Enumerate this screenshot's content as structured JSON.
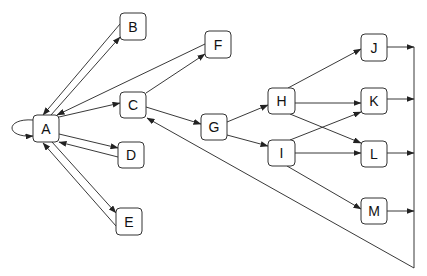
{
  "diagram": {
    "type": "directed-graph",
    "colors": {
      "stroke": "#222222",
      "node_fill": "#ffffff",
      "text": "#111111"
    },
    "nodes": [
      {
        "id": "A",
        "label": "A",
        "x": 33,
        "y": 115,
        "w": 26,
        "h": 27
      },
      {
        "id": "B",
        "label": "B",
        "x": 120,
        "y": 13,
        "w": 26,
        "h": 27
      },
      {
        "id": "C",
        "label": "C",
        "x": 120,
        "y": 92,
        "w": 26,
        "h": 26
      },
      {
        "id": "D",
        "label": "D",
        "x": 118,
        "y": 142,
        "w": 26,
        "h": 26
      },
      {
        "id": "E",
        "label": "E",
        "x": 116,
        "y": 208,
        "w": 26,
        "h": 27
      },
      {
        "id": "F",
        "label": "F",
        "x": 205,
        "y": 31,
        "w": 26,
        "h": 27
      },
      {
        "id": "G",
        "label": "G",
        "x": 201,
        "y": 114,
        "w": 26,
        "h": 26
      },
      {
        "id": "H",
        "label": "H",
        "x": 268,
        "y": 88,
        "w": 27,
        "h": 26
      },
      {
        "id": "I",
        "label": "I",
        "x": 268,
        "y": 140,
        "w": 27,
        "h": 26
      },
      {
        "id": "J",
        "label": "J",
        "x": 361,
        "y": 34,
        "w": 26,
        "h": 27
      },
      {
        "id": "K",
        "label": "K",
        "x": 361,
        "y": 88,
        "w": 26,
        "h": 26
      },
      {
        "id": "L",
        "label": "L",
        "x": 361,
        "y": 141,
        "w": 26,
        "h": 26
      },
      {
        "id": "M",
        "label": "M",
        "x": 361,
        "y": 198,
        "w": 26,
        "h": 26
      }
    ],
    "edges": [
      {
        "from": "A",
        "to": "A",
        "kind": "self-loop"
      },
      {
        "from": "A",
        "to": "B"
      },
      {
        "from": "B",
        "to": "A"
      },
      {
        "from": "A",
        "to": "C"
      },
      {
        "from": "F",
        "to": "A"
      },
      {
        "from": "C",
        "to": "F"
      },
      {
        "from": "A",
        "to": "D"
      },
      {
        "from": "D",
        "to": "A"
      },
      {
        "from": "A",
        "to": "E"
      },
      {
        "from": "E",
        "to": "A"
      },
      {
        "from": "C",
        "to": "G"
      },
      {
        "from": "G",
        "to": "H"
      },
      {
        "from": "G",
        "to": "I"
      },
      {
        "from": "H",
        "to": "J"
      },
      {
        "from": "H",
        "to": "K"
      },
      {
        "from": "H",
        "to": "L"
      },
      {
        "from": "I",
        "to": "K"
      },
      {
        "from": "I",
        "to": "L"
      },
      {
        "from": "I",
        "to": "M"
      },
      {
        "from": "J",
        "to": "bus"
      },
      {
        "from": "K",
        "to": "bus"
      },
      {
        "from": "L",
        "to": "bus"
      },
      {
        "from": "M",
        "to": "bus"
      },
      {
        "from": "bus",
        "to": "C",
        "kind": "feedback"
      }
    ]
  }
}
